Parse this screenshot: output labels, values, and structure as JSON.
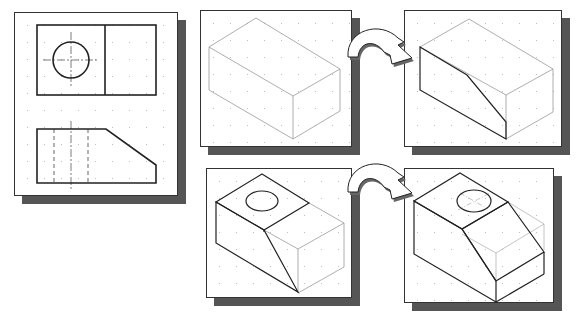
{
  "figure": {
    "panels": [
      {
        "id": "orthographic-views",
        "label": "Top and front orthographic views",
        "x": 14,
        "y": 12,
        "w": 164,
        "h": 184
      },
      {
        "id": "step-1-box",
        "label": "Isometric bounding box",
        "x": 200,
        "y": 10,
        "w": 152,
        "h": 137
      },
      {
        "id": "step-2-slant",
        "label": "Slanted cut on front face",
        "x": 404,
        "y": 10,
        "w": 158,
        "h": 137
      },
      {
        "id": "step-3-hole",
        "label": "Top face with circular hole",
        "x": 206,
        "y": 168,
        "w": 146,
        "h": 130
      },
      {
        "id": "step-4-final",
        "label": "Completed isometric object",
        "x": 404,
        "y": 168,
        "w": 150,
        "h": 135
      }
    ],
    "arrows": [
      {
        "id": "arrow-top",
        "from": "step-1-box",
        "to": "step-2-slant"
      },
      {
        "id": "arrow-bottom",
        "from": "step-3-hole",
        "to": "step-4-final"
      }
    ],
    "colors": {
      "panel_border": "#333333",
      "shadow": "#555555",
      "line": "#222222",
      "construction_line": "#9a9a9a",
      "grid_dot": "#bfbfbf"
    }
  }
}
